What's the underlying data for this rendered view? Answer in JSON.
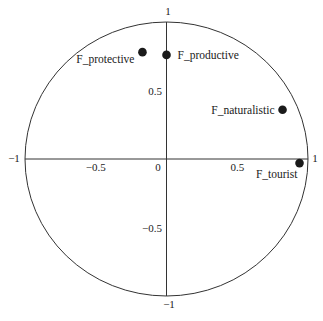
{
  "chart_data": {
    "type": "scatter",
    "title": "",
    "xlabel": "",
    "ylabel": "",
    "xlim": [
      -1,
      1
    ],
    "ylim": [
      -1,
      1
    ],
    "grid": false,
    "legend": null,
    "unit_circle": true,
    "x_ticks": [
      -1,
      -0.5,
      0,
      0.5,
      1
    ],
    "y_ticks": [
      -1,
      -0.5,
      0.5,
      1
    ],
    "x_tick_labels": [
      "−1",
      "−0.5",
      "0",
      "0.5",
      "1"
    ],
    "y_tick_labels": [
      "−1",
      "−0.5",
      "0.5",
      "1"
    ],
    "points": [
      {
        "label": "F_protective",
        "x": -0.17,
        "y": 0.78,
        "label_pos": "left-below"
      },
      {
        "label": "F_productive",
        "x": 0.0,
        "y": 0.76,
        "label_pos": "right"
      },
      {
        "label": "F_naturalistic",
        "x": 0.82,
        "y": 0.36,
        "label_pos": "left"
      },
      {
        "label": "F_tourist",
        "x": 0.94,
        "y": -0.03,
        "label_pos": "below-left"
      }
    ],
    "marker_color": "#1a1a1a",
    "line_color": "#333333"
  }
}
